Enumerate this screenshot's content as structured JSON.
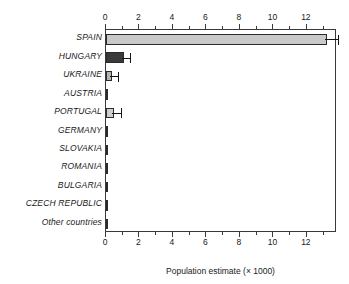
{
  "chart_data": {
    "type": "bar",
    "orientation": "horizontal",
    "title": "",
    "xlabel": "Population estimate (× 1000)",
    "ylabel": "",
    "xlim": [
      0,
      13.8
    ],
    "grid": false,
    "legend": "none",
    "axis_top": true,
    "axis_bottom": true,
    "tick_labels": [
      "0",
      "2",
      "4",
      "6",
      "8",
      "10",
      "12"
    ],
    "tick_values": [
      0,
      2,
      4,
      6,
      8,
      10,
      12
    ],
    "minor_tick_values": [
      1,
      3,
      5,
      7,
      9,
      11,
      13
    ],
    "categories": [
      "SPAIN",
      "HUNGARY",
      "UKRAINE",
      "AUSTRIA",
      "PORTUGAL",
      "GERMANY",
      "SLOVAKIA",
      "ROMANIA",
      "BULGARIA",
      "CZECH REPUBLIC",
      "Other countries"
    ],
    "values": [
      13.2,
      1.05,
      0.34,
      0.04,
      0.5,
      0.08,
      0.03,
      0.02,
      0.02,
      0.02,
      0.01
    ],
    "errors_upper": [
      13.75,
      1.3,
      0.62,
      0.04,
      0.75,
      0.08,
      0.03,
      0.02,
      0.02,
      0.02,
      0.01
    ],
    "bar_colors": [
      "#c9c9c9",
      "#3a3a3a",
      "#b5b5b5",
      "#2b2b2b",
      "#cfcfcf",
      "#2b2b2b",
      "#2b2b2b",
      "#2b2b2b",
      "#2b2b2b",
      "#2b2b2b",
      "#2b2b2b"
    ],
    "edge_color": "#2b2b2b",
    "error_color": "#151515"
  },
  "colors": {
    "background": "#ffffff",
    "frame": "#3a3a3a",
    "text": "#1a1a1a",
    "light_bar": "#c9c9c9",
    "dark_bar": "#3a3a3a"
  }
}
